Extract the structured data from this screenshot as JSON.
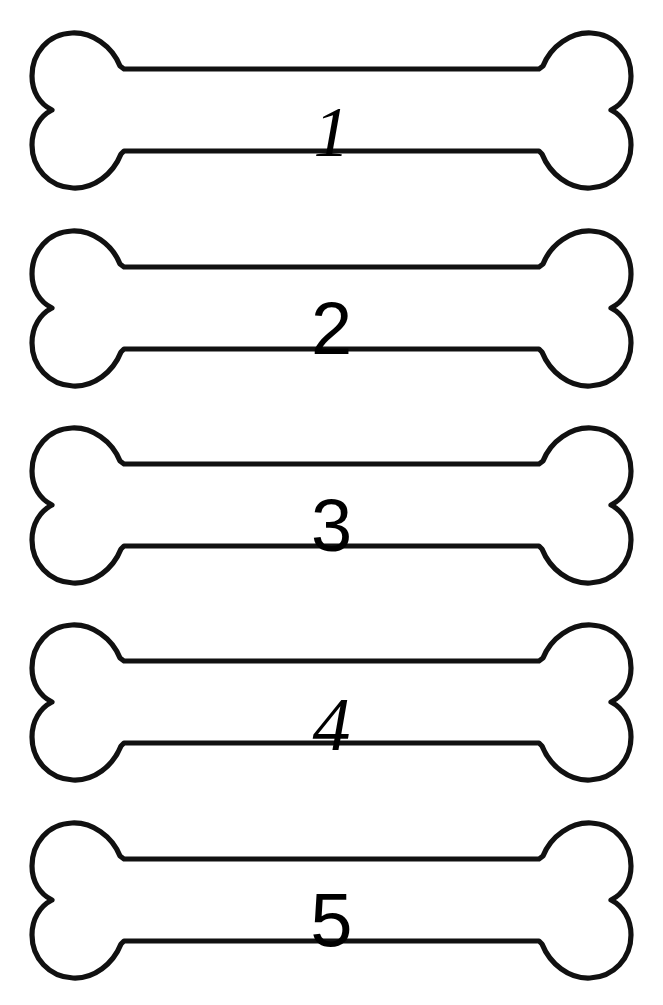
{
  "page": {
    "background_color": "#ffffff",
    "ink_color": "#111111",
    "width": 663,
    "height": 1005,
    "orientation": "portrait"
  },
  "artwork": {
    "subject": "dog-bone",
    "style": "hand-drawn black outline, unfilled",
    "count": 5,
    "arrangement": "vertical-stack"
  },
  "bones": [
    {
      "id": "bone-1",
      "number": "1",
      "top": 20,
      "number_style": "italic-serif"
    },
    {
      "id": "bone-2",
      "number": "2",
      "top": 218,
      "number_style": "upright-sans"
    },
    {
      "id": "bone-3",
      "number": "3",
      "top": 415,
      "number_style": "upright-sans"
    },
    {
      "id": "bone-4",
      "number": "4",
      "top": 612,
      "number_style": "italic-serif"
    },
    {
      "id": "bone-5",
      "number": "5",
      "top": 810,
      "number_style": "upright-sans"
    }
  ]
}
